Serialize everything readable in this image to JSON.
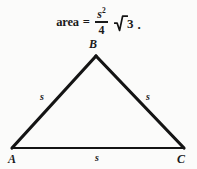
{
  "figure": {
    "background_color": "#fbfbfa",
    "stroke_color": "#141414",
    "formula": {
      "word": "area",
      "equals": "=",
      "numerator": "s",
      "numerator_exponent": "2",
      "denominator": "4",
      "radicand": "3",
      "period": ".",
      "full_text": "area = s²/4 √3."
    },
    "triangle": {
      "vertices": [
        {
          "name": "A",
          "label": "A",
          "x": 12,
          "y": 148
        },
        {
          "name": "B",
          "label": "B",
          "x": 96,
          "y": 56
        },
        {
          "name": "C",
          "label": "C",
          "x": 184,
          "y": 148
        }
      ],
      "sides": [
        {
          "name": "AB",
          "label": "s"
        },
        {
          "name": "BC",
          "label": "s"
        },
        {
          "name": "AC",
          "label": "s"
        }
      ]
    }
  }
}
